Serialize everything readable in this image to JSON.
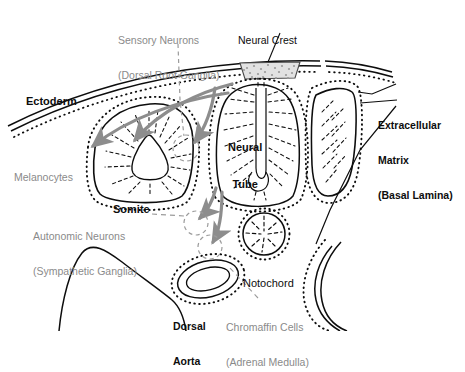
{
  "figure": {
    "colors": {
      "ink": "#0d0d0d",
      "gray_label": "#8a8a8a",
      "gray_arrow": "#8d8d8d",
      "stipple": "#b8b8b8",
      "background": "#ffffff"
    }
  },
  "labels": {
    "sensory_neurons": {
      "line1": "Sensory Neurons",
      "line2": "(Dorsal Root Ganglia)",
      "style": "gray"
    },
    "neural_crest": {
      "line1": "Neural Crest",
      "style": "black"
    },
    "ectoderm": {
      "line1": "Ectoderm",
      "style": "black"
    },
    "melanocytes": {
      "line1": "Melanocytes",
      "style": "gray"
    },
    "neural_tube": {
      "line1": "Neural",
      "line2": "Tube",
      "style": "black"
    },
    "somite": {
      "line1": "Somite",
      "style": "black"
    },
    "extracellular_matrix": {
      "line1": "Extracellular",
      "line2": "Matrix",
      "line3": "(Basal Lamina)",
      "style": "black"
    },
    "autonomic_neurons": {
      "line1": "Autonomic Neurons",
      "line2": "(Sympathetic Ganglia)",
      "style": "gray"
    },
    "notochord": {
      "line1": "Notochord",
      "style": "black"
    },
    "dorsal_aorta": {
      "line1": "Dorsal",
      "line2": "Aorta",
      "style": "black"
    },
    "chromaffin_cells": {
      "line1": "Chromaffin Cells",
      "line2": "(Adrenal Medulla)",
      "style": "gray"
    }
  }
}
